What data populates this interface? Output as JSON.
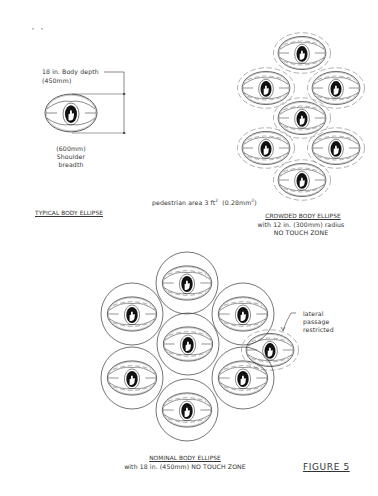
{
  "figure": {
    "label": "FIGURE 5"
  },
  "typical": {
    "title": "TYPICAL BODY ELLIPSE",
    "depth_label": "18 in. Body depth",
    "depth_metric": "(450mm)",
    "breadth_metric": "(600mm)",
    "breadth_label_1": "Shoulder",
    "breadth_label_2": "breadth"
  },
  "crowded": {
    "title": "CROWDED BODY ELLIPSE",
    "subtitle_1": "with 12 in. (300mm) radius",
    "subtitle_2": "NO TOUCH ZONE",
    "area_prefix": "pedestrian area 3 ft",
    "area_sup": "2",
    "area_metric_prefix": "(0.28mm",
    "area_metric_sup": "2",
    "area_metric_suffix": ")",
    "ellipse_centers": [
      [
        302,
        53
      ],
      [
        266,
        88
      ],
      [
        336,
        88
      ],
      [
        302,
        118
      ],
      [
        266,
        148
      ],
      [
        336,
        148
      ],
      [
        302,
        180
      ]
    ]
  },
  "nominal": {
    "title": "NOMINAL BODY ELLIPSE",
    "subtitle": "with 18 in. (450mm) NO TOUCH ZONE",
    "circle_centers": [
      [
        187,
        283
      ],
      [
        132,
        314
      ],
      [
        243,
        314
      ],
      [
        188,
        344
      ],
      [
        132,
        378
      ],
      [
        243,
        378
      ],
      [
        187,
        410
      ]
    ],
    "circle_radius": 31,
    "lateral_label_1": "lateral",
    "lateral_label_2": "passage",
    "lateral_label_3": "restricted",
    "lateral_ellipse_center": [
      270,
      350
    ]
  },
  "colors": {
    "line": "#3a3a3a",
    "head": "#111111",
    "background": "#ffffff"
  }
}
